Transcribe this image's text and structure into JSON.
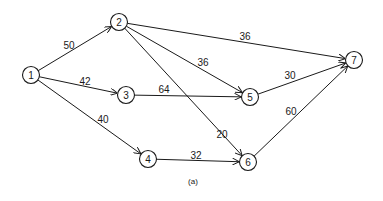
{
  "diagram": {
    "type": "directed-network",
    "caption": "(a)",
    "nodes": [
      {
        "id": "1",
        "label": "1"
      },
      {
        "id": "2",
        "label": "2"
      },
      {
        "id": "3",
        "label": "3"
      },
      {
        "id": "4",
        "label": "4"
      },
      {
        "id": "5",
        "label": "5"
      },
      {
        "id": "6",
        "label": "6"
      },
      {
        "id": "7",
        "label": "7"
      }
    ],
    "edges": [
      {
        "from": "1",
        "to": "2",
        "weight": "50"
      },
      {
        "from": "1",
        "to": "3",
        "weight": "42"
      },
      {
        "from": "1",
        "to": "4",
        "weight": "40"
      },
      {
        "from": "2",
        "to": "7",
        "weight": "36"
      },
      {
        "from": "2",
        "to": "5",
        "weight": "36"
      },
      {
        "from": "2",
        "to": "6",
        "weight": "20"
      },
      {
        "from": "3",
        "to": "5",
        "weight": "64"
      },
      {
        "from": "4",
        "to": "6",
        "weight": "32"
      },
      {
        "from": "5",
        "to": "7",
        "weight": "30"
      },
      {
        "from": "6",
        "to": "7",
        "weight": "60"
      }
    ]
  }
}
